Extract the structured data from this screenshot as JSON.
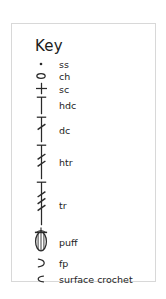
{
  "panel": {
    "title": "Key",
    "border_color": "#d8d8d8",
    "background_color": "#ffffff",
    "ink_color": "#232323"
  },
  "legend": {
    "items": [
      {
        "symbol": "dot",
        "label": "ss"
      },
      {
        "symbol": "oval-open",
        "label": "ch"
      },
      {
        "symbol": "cross",
        "label": "sc"
      },
      {
        "symbol": "tee-bar",
        "label": "hdc"
      },
      {
        "symbol": "tee-bar-one-slash",
        "label": "dc"
      },
      {
        "symbol": "tee-bar-two-slash",
        "label": "htr"
      },
      {
        "symbol": "tee-bar-three-slash",
        "label": "tr"
      },
      {
        "symbol": "puff-bobble",
        "label": "puff"
      },
      {
        "symbol": "crescent-right",
        "label": "fp"
      },
      {
        "symbol": "crescent-left",
        "label": "surface crochet"
      }
    ]
  }
}
